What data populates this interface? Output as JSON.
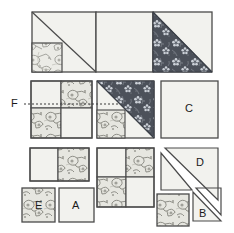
{
  "diagram": {
    "background_color": "#ffffff",
    "ink_color": "#444444",
    "plain_fabric_color": "#f2f2ee",
    "light_floral_color": "#e7e7e2",
    "dark_floral_color": "#4a4f58",
    "dark_floral_motif_color": "#c9cdd4",
    "guide_line_style": "dotted"
  },
  "labels": {
    "a": "A",
    "b": "B",
    "c": "C",
    "d": "D",
    "e": "E",
    "f": "F"
  },
  "rows": [
    {
      "name": "top-row",
      "units": [
        {
          "id": "top-left-unit",
          "description": "square with diagonal seam, light triangle over plain, small light floral square in lower-left corner",
          "fabrics": [
            "plain",
            "light-floral"
          ]
        },
        {
          "id": "top-middle-unit",
          "description": "plain square",
          "fabrics": [
            "plain"
          ]
        },
        {
          "id": "top-right-unit",
          "description": "half-square triangle, dark floral upper-left over plain lower-right",
          "fabrics": [
            "dark-floral",
            "plain"
          ]
        }
      ]
    },
    {
      "name": "middle-row",
      "units": [
        {
          "id": "four-patch-left",
          "description": "four patch: plain, light floral / light floral, plain",
          "fabrics": [
            "plain",
            "light-floral"
          ]
        },
        {
          "id": "hst-dark-unit",
          "description": "half-square triangle dark floral upper-right with light floral square lower-left",
          "fabrics": [
            "dark-floral",
            "light-floral",
            "plain"
          ]
        },
        {
          "id": "square-c",
          "description": "plain square labelled C",
          "label": "C",
          "fabrics": [
            "plain"
          ]
        }
      ]
    },
    {
      "name": "bottom-row",
      "units": [
        {
          "id": "two-patch-rectangle",
          "description": "rectangle of two squares: plain left, light floral right",
          "fabrics": [
            "plain",
            "light-floral"
          ]
        },
        {
          "id": "four-patch-bottom",
          "description": "four patch: plain, light floral / light floral, plain",
          "fabrics": [
            "plain",
            "light-floral"
          ]
        },
        {
          "id": "triangle-pair-d",
          "description": "square cut on the diagonal into two plain triangles, larger one labelled D",
          "label": "D",
          "fabrics": [
            "plain"
          ]
        },
        {
          "id": "square-e",
          "description": "light floral square labelled E",
          "label": "E",
          "fabrics": [
            "light-floral"
          ]
        },
        {
          "id": "square-a",
          "description": "plain square labelled A",
          "label": "A",
          "fabrics": [
            "plain"
          ]
        },
        {
          "id": "square-floral-small",
          "description": "small light floral square",
          "fabrics": [
            "light-floral"
          ]
        },
        {
          "id": "triangle-b",
          "description": "plain triangle labelled B",
          "label": "B",
          "fabrics": [
            "plain"
          ]
        }
      ]
    }
  ],
  "guide": {
    "id": "f-guide-line",
    "label": "F",
    "description": "dotted horizontal guide line from label F across the four patch to the diagonal seam"
  }
}
